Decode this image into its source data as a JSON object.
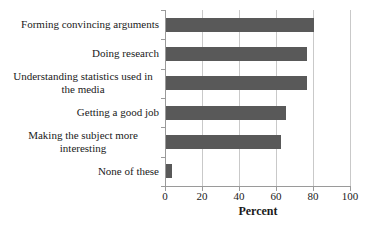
{
  "chart_data": {
    "type": "bar",
    "orientation": "horizontal",
    "categories": [
      "Forming convincing arguments",
      "Doing research",
      "Understanding statistics used in the media",
      "Getting a good job",
      "Making the subject more interesting",
      "None of these"
    ],
    "values": [
      80,
      76,
      76,
      65,
      62,
      3
    ],
    "title": "",
    "xlabel": "Percent",
    "ylabel": "",
    "xlim": [
      0,
      100
    ],
    "x_ticks": [
      0,
      20,
      40,
      60,
      80,
      100
    ],
    "grid": "vertical gridlines on",
    "legend": "none",
    "bar_color": "#595959",
    "gridline_color": "#c9c9c9",
    "axis_color": "#9a9a9a",
    "text_color": "#1a1a1a"
  }
}
